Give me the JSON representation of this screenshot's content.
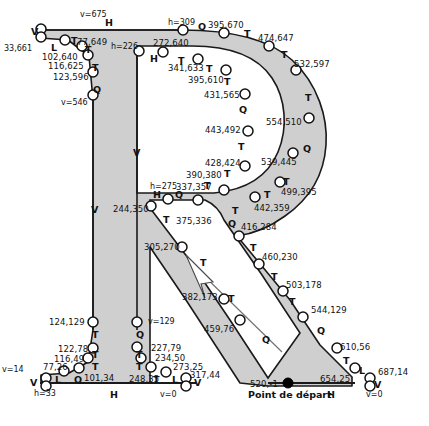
{
  "figure": {
    "shape_fill": "#cfcfcf",
    "stroke": "#1a1a1a",
    "start_point_label": "Point de départ",
    "start_point_coord": "520,-1",
    "caption": ""
  },
  "chart_data": {
    "type": "scatter",
    "xlabel": "",
    "ylabel": "",
    "legend": [
      "H",
      "V",
      "L",
      "T",
      "Q"
    ],
    "nodes": [
      {
        "coord": "v=675",
        "tag": "V"
      },
      {
        "coord": "33,661",
        "tag": "L"
      },
      {
        "coord": "77,649",
        "tag": "T"
      },
      {
        "coord": "102,640",
        "tag": "T"
      },
      {
        "coord": "116,625",
        "tag": "T"
      },
      {
        "coord": "123,596",
        "tag": "Q"
      },
      {
        "coord": "v=546",
        "tag": "V"
      },
      {
        "coord": "h=309",
        "tag": "Q"
      },
      {
        "coord": "395,670",
        "tag": "T"
      },
      {
        "coord": "474,647",
        "tag": "T"
      },
      {
        "coord": "532,597",
        "tag": "T"
      },
      {
        "coord": "554,510",
        "tag": "Q"
      },
      {
        "coord": "539,445",
        "tag": "T"
      },
      {
        "coord": "499,395",
        "tag": "T"
      },
      {
        "coord": "442,359",
        "tag": "Q"
      },
      {
        "coord": "416,284",
        "tag": "T"
      },
      {
        "coord": "460,230",
        "tag": "T"
      },
      {
        "coord": "503,178",
        "tag": "T"
      },
      {
        "coord": "544,129",
        "tag": "Q"
      },
      {
        "coord": "610,56",
        "tag": "T"
      },
      {
        "coord": "654,25",
        "tag": "L"
      },
      {
        "coord": "687,14",
        "tag": "V"
      },
      {
        "coord": "v=0",
        "tag": "H"
      },
      {
        "coord": "520,-1",
        "tag": "Q"
      },
      {
        "coord": "459,76",
        "tag": "T"
      },
      {
        "coord": "382,173",
        "tag": "T"
      },
      {
        "coord": "305,270",
        "tag": "T"
      },
      {
        "coord": "244,350",
        "tag": "H"
      },
      {
        "coord": "h=275",
        "tag": "Q"
      },
      {
        "coord": "337,357",
        "tag": "T"
      },
      {
        "coord": "390,380",
        "tag": "T"
      },
      {
        "coord": "428,424",
        "tag": "T"
      },
      {
        "coord": "443,492",
        "tag": "Q"
      },
      {
        "coord": "431,565",
        "tag": "T"
      },
      {
        "coord": "395,610",
        "tag": "T"
      },
      {
        "coord": "341,633",
        "tag": "T"
      },
      {
        "coord": "272,640",
        "tag": "H"
      },
      {
        "coord": "h=226",
        "tag": "V"
      },
      {
        "coord": "v=129",
        "tag": "Q"
      },
      {
        "coord": "227,79",
        "tag": "T"
      },
      {
        "coord": "234,50",
        "tag": "T"
      },
      {
        "coord": "248,35",
        "tag": "T"
      },
      {
        "coord": "273,25",
        "tag": "L"
      },
      {
        "coord": "317,44",
        "tag": "V"
      },
      {
        "coord": "v=0",
        "tag": "H"
      },
      {
        "coord": "h=33",
        "tag": "V"
      },
      {
        "coord": "v=14",
        "tag": "V"
      },
      {
        "coord": "77,26",
        "tag": "L"
      },
      {
        "coord": "101,34",
        "tag": "Q"
      },
      {
        "coord": "116,49",
        "tag": "T"
      },
      {
        "coord": "122,78",
        "tag": "T"
      },
      {
        "coord": "124,129",
        "tag": "T"
      },
      {
        "coord": "375,336",
        "tag": "Q"
      }
    ]
  },
  "labels": {
    "coords": [
      {
        "t": "v=675",
        "x": 80,
        "y": 11,
        "cls": "axis"
      },
      {
        "t": "33,661",
        "x": 4,
        "y": 45,
        "cls": "axis"
      },
      {
        "t": "77,649",
        "x": 77,
        "y": 38,
        "cls": "coord"
      },
      {
        "t": "102,640",
        "x": 42,
        "y": 53,
        "cls": "coord"
      },
      {
        "t": "116,625",
        "x": 48,
        "y": 62,
        "cls": "coord"
      },
      {
        "t": "123,596",
        "x": 53,
        "y": 73,
        "cls": "coord"
      },
      {
        "t": "v=546",
        "x": 61,
        "y": 99,
        "cls": "axis"
      },
      {
        "t": "h=226",
        "x": 111,
        "y": 43,
        "cls": "axis"
      },
      {
        "t": "272,640",
        "x": 153,
        "y": 39,
        "cls": "coord"
      },
      {
        "t": "h=309",
        "x": 168,
        "y": 19,
        "cls": "axis"
      },
      {
        "t": "395,670",
        "x": 208,
        "y": 21,
        "cls": "coord"
      },
      {
        "t": "474,647",
        "x": 258,
        "y": 34,
        "cls": "coord"
      },
      {
        "t": "532,597",
        "x": 294,
        "y": 60,
        "cls": "coord"
      },
      {
        "t": "554,510",
        "x": 266,
        "y": 118,
        "cls": "coord"
      },
      {
        "t": "539,445",
        "x": 261,
        "y": 158,
        "cls": "coord"
      },
      {
        "t": "499,395",
        "x": 281,
        "y": 188,
        "cls": "coord"
      },
      {
        "t": "442,359",
        "x": 254,
        "y": 204,
        "cls": "coord"
      },
      {
        "t": "416,284",
        "x": 241,
        "y": 223,
        "cls": "coord"
      },
      {
        "t": "460,230",
        "x": 262,
        "y": 253,
        "cls": "coord"
      },
      {
        "t": "503,178",
        "x": 286,
        "y": 281,
        "cls": "coord"
      },
      {
        "t": "544,129",
        "x": 311,
        "y": 306,
        "cls": "coord"
      },
      {
        "t": "610,56",
        "x": 340,
        "y": 343,
        "cls": "coord"
      },
      {
        "t": "654,25",
        "x": 320,
        "y": 375,
        "cls": "coord"
      },
      {
        "t": "687,14",
        "x": 378,
        "y": 368,
        "cls": "coord"
      },
      {
        "t": "v=0",
        "x": 366,
        "y": 391,
        "cls": "axis"
      },
      {
        "t": "520,-1",
        "x": 250,
        "y": 380,
        "cls": "coord"
      },
      {
        "t": "459,76",
        "x": 204,
        "y": 325,
        "cls": "coord"
      },
      {
        "t": "382,173",
        "x": 182,
        "y": 293,
        "cls": "coord"
      },
      {
        "t": "305,270",
        "x": 144,
        "y": 243,
        "cls": "coord"
      },
      {
        "t": "244,350",
        "x": 113,
        "y": 205,
        "cls": "coord"
      },
      {
        "t": "h=275",
        "x": 150,
        "y": 183,
        "cls": "axis"
      },
      {
        "t": "337,357",
        "x": 176,
        "y": 183,
        "cls": "coord"
      },
      {
        "t": "390,380",
        "x": 186,
        "y": 171,
        "cls": "coord"
      },
      {
        "t": "428,424",
        "x": 205,
        "y": 159,
        "cls": "coord"
      },
      {
        "t": "443,492",
        "x": 205,
        "y": 126,
        "cls": "coord"
      },
      {
        "t": "431,565",
        "x": 204,
        "y": 91,
        "cls": "coord"
      },
      {
        "t": "395,610",
        "x": 188,
        "y": 76,
        "cls": "coord"
      },
      {
        "t": "341,633",
        "x": 168,
        "y": 64,
        "cls": "coord"
      },
      {
        "t": "375,336",
        "x": 176,
        "y": 217,
        "cls": "coord"
      },
      {
        "t": "124,129",
        "x": 49,
        "y": 318,
        "cls": "coord"
      },
      {
        "t": "122,78",
        "x": 58,
        "y": 345,
        "cls": "coord"
      },
      {
        "t": "116,49",
        "x": 54,
        "y": 355,
        "cls": "coord"
      },
      {
        "t": "77,26",
        "x": 43,
        "y": 363,
        "cls": "coord"
      },
      {
        "t": "101,34",
        "x": 84,
        "y": 374,
        "cls": "coord"
      },
      {
        "t": "v=14",
        "x": 2,
        "y": 366,
        "cls": "axis"
      },
      {
        "t": "h=33",
        "x": 34,
        "y": 390,
        "cls": "axis"
      },
      {
        "t": "v=129",
        "x": 148,
        "y": 318,
        "cls": "axis"
      },
      {
        "t": "227,79",
        "x": 151,
        "y": 344,
        "cls": "coord"
      },
      {
        "t": "234,50",
        "x": 155,
        "y": 354,
        "cls": "coord"
      },
      {
        "t": "248,35",
        "x": 129,
        "y": 375,
        "cls": "coord"
      },
      {
        "t": "273,25",
        "x": 173,
        "y": 363,
        "cls": "coord"
      },
      {
        "t": "317,44",
        "x": 190,
        "y": 371,
        "cls": "coord"
      },
      {
        "t": "v=0",
        "x": 160,
        "y": 391,
        "cls": "axis"
      }
    ],
    "tags": [
      {
        "t": "V",
        "x": 31,
        "y": 27
      },
      {
        "t": "H",
        "x": 105,
        "y": 18
      },
      {
        "t": "L",
        "x": 51,
        "y": 43
      },
      {
        "t": "T",
        "x": 71,
        "y": 36
      },
      {
        "t": "T",
        "x": 85,
        "y": 45
      },
      {
        "t": "T",
        "x": 92,
        "y": 63
      },
      {
        "t": "Q",
        "x": 93,
        "y": 85
      },
      {
        "t": "Q",
        "x": 198,
        "y": 22
      },
      {
        "t": "H",
        "x": 150,
        "y": 54
      },
      {
        "t": "T",
        "x": 244,
        "y": 29
      },
      {
        "t": "T",
        "x": 178,
        "y": 56
      },
      {
        "t": "T",
        "x": 281,
        "y": 50
      },
      {
        "t": "T",
        "x": 206,
        "y": 64
      },
      {
        "t": "T",
        "x": 305,
        "y": 93
      },
      {
        "t": "T",
        "x": 224,
        "y": 77
      },
      {
        "t": "Q",
        "x": 239,
        "y": 105
      },
      {
        "t": "Q",
        "x": 303,
        "y": 144
      },
      {
        "t": "T",
        "x": 238,
        "y": 142
      },
      {
        "t": "T",
        "x": 283,
        "y": 177
      },
      {
        "t": "T",
        "x": 224,
        "y": 169
      },
      {
        "t": "T",
        "x": 264,
        "y": 190
      },
      {
        "t": "T",
        "x": 204,
        "y": 181
      },
      {
        "t": "T",
        "x": 232,
        "y": 206
      },
      {
        "t": "H",
        "x": 153,
        "y": 190
      },
      {
        "t": "Q",
        "x": 175,
        "y": 190
      },
      {
        "t": "Q",
        "x": 228,
        "y": 219
      },
      {
        "t": "T",
        "x": 163,
        "y": 215
      },
      {
        "t": "T",
        "x": 250,
        "y": 243
      },
      {
        "t": "T",
        "x": 271,
        "y": 272
      },
      {
        "t": "T",
        "x": 200,
        "y": 258
      },
      {
        "t": "T",
        "x": 289,
        "y": 297
      },
      {
        "t": "T",
        "x": 228,
        "y": 294
      },
      {
        "t": "Q",
        "x": 317,
        "y": 326
      },
      {
        "t": "Q",
        "x": 262,
        "y": 335
      },
      {
        "t": "T",
        "x": 343,
        "y": 356
      },
      {
        "t": "L",
        "x": 359,
        "y": 366
      },
      {
        "t": "V",
        "x": 374,
        "y": 380
      },
      {
        "t": "H",
        "x": 327,
        "y": 390
      },
      {
        "t": "T",
        "x": 92,
        "y": 330
      },
      {
        "t": "T",
        "x": 92,
        "y": 350
      },
      {
        "t": "T",
        "x": 92,
        "y": 362
      },
      {
        "t": "Q",
        "x": 74,
        "y": 375
      },
      {
        "t": "L",
        "x": 55,
        "y": 375
      },
      {
        "t": "V",
        "x": 30,
        "y": 378
      },
      {
        "t": "H",
        "x": 110,
        "y": 390
      },
      {
        "t": "Q",
        "x": 136,
        "y": 330
      },
      {
        "t": "T",
        "x": 136,
        "y": 350
      },
      {
        "t": "T",
        "x": 136,
        "y": 362
      },
      {
        "t": "T",
        "x": 153,
        "y": 375
      },
      {
        "t": "L",
        "x": 172,
        "y": 375
      },
      {
        "t": "V",
        "x": 194,
        "y": 378
      },
      {
        "t": "V",
        "x": 133,
        "y": 148
      },
      {
        "t": "V",
        "x": 91,
        "y": 205
      }
    ]
  }
}
